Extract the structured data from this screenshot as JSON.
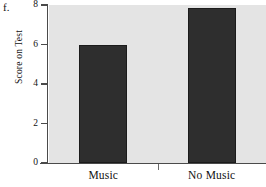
{
  "figure": {
    "part_label": "f."
  },
  "chart_data": {
    "type": "bar",
    "title": "",
    "xlabel": "",
    "ylabel": "Score on Test",
    "categories": [
      "Music",
      "No Music"
    ],
    "values": [
      6.0,
      7.85
    ],
    "ylim": [
      0,
      8
    ],
    "yticks": [
      0,
      2,
      4,
      6,
      8
    ],
    "ytick_labels": [
      "0",
      "2",
      "4",
      "6",
      "8"
    ],
    "grid": false,
    "legend": null,
    "colors": {
      "bar_fill": "#2e2e2e",
      "bar_edge": "#1b1b1b",
      "plot_background": "#e4e4e4",
      "figure_background": "#ffffff",
      "axis": "#4a4a4a",
      "text": "#111111"
    }
  }
}
